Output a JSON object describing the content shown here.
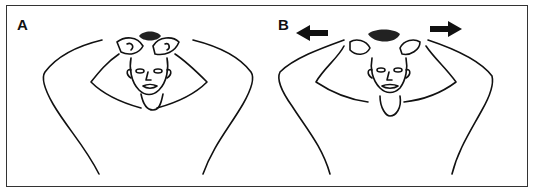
{
  "figure": {
    "panels": [
      {
        "label": "A",
        "description": "Person with hands clasped on top of head, elbows out"
      },
      {
        "label": "B",
        "description": "Person with hands on head, elbows pulled apart",
        "arrows": [
          "left-arrow",
          "right-arrow"
        ]
      }
    ],
    "colors": {
      "line": "#111111",
      "background": "#ffffff",
      "border": "#333333"
    }
  }
}
